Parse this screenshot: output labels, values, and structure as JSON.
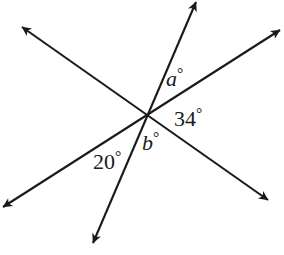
{
  "figure": {
    "kind": "geometry-diagram",
    "background_color": "#ffffff",
    "stroke_color": "#1a1a1a",
    "canvas": {
      "width": 284,
      "height": 255
    },
    "intersection_point": {
      "x": 148,
      "y": 118
    }
  },
  "lines": [
    {
      "id": "line-1",
      "name": "line-upper-left-to-lower-right",
      "from": {
        "x": 22,
        "y": 27
      },
      "to": {
        "x": 268,
        "y": 200
      },
      "arrow_start": true,
      "arrow_end": true
    },
    {
      "id": "line-2",
      "name": "line-lower-left-to-upper-right",
      "from": {
        "x": 3,
        "y": 207
      },
      "to": {
        "x": 280,
        "y": 30
      },
      "arrow_start": true,
      "arrow_end": true
    },
    {
      "id": "line-3",
      "name": "line-top-to-bottom",
      "from": {
        "x": 196,
        "y": 2
      },
      "to": {
        "x": 93,
        "y": 243
      },
      "arrow_start": true,
      "arrow_end": true
    }
  ],
  "labels": {
    "a": {
      "text": "a",
      "degree": "°",
      "style": "italic",
      "position": {
        "x": 166,
        "y": 66
      }
    },
    "thirtyfour": {
      "text": "34",
      "degree": "°",
      "style": "upright",
      "position": {
        "x": 174,
        "y": 106
      }
    },
    "b": {
      "text": "b",
      "degree": "°",
      "style": "italic",
      "position": {
        "x": 142,
        "y": 130
      }
    },
    "twenty": {
      "text": "20",
      "degree": "°",
      "style": "upright",
      "position": {
        "x": 93,
        "y": 149
      }
    }
  }
}
